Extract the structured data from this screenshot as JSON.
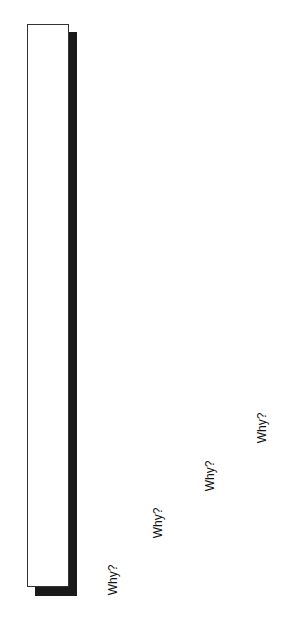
{
  "diagram": {
    "box": {
      "fill": "#ffffff",
      "border": "#333333",
      "shadow": "#1a1a1a"
    },
    "labels": [
      {
        "text": "Why?"
      },
      {
        "text": "Why?"
      },
      {
        "text": "Why?"
      },
      {
        "text": "Why?"
      }
    ]
  }
}
